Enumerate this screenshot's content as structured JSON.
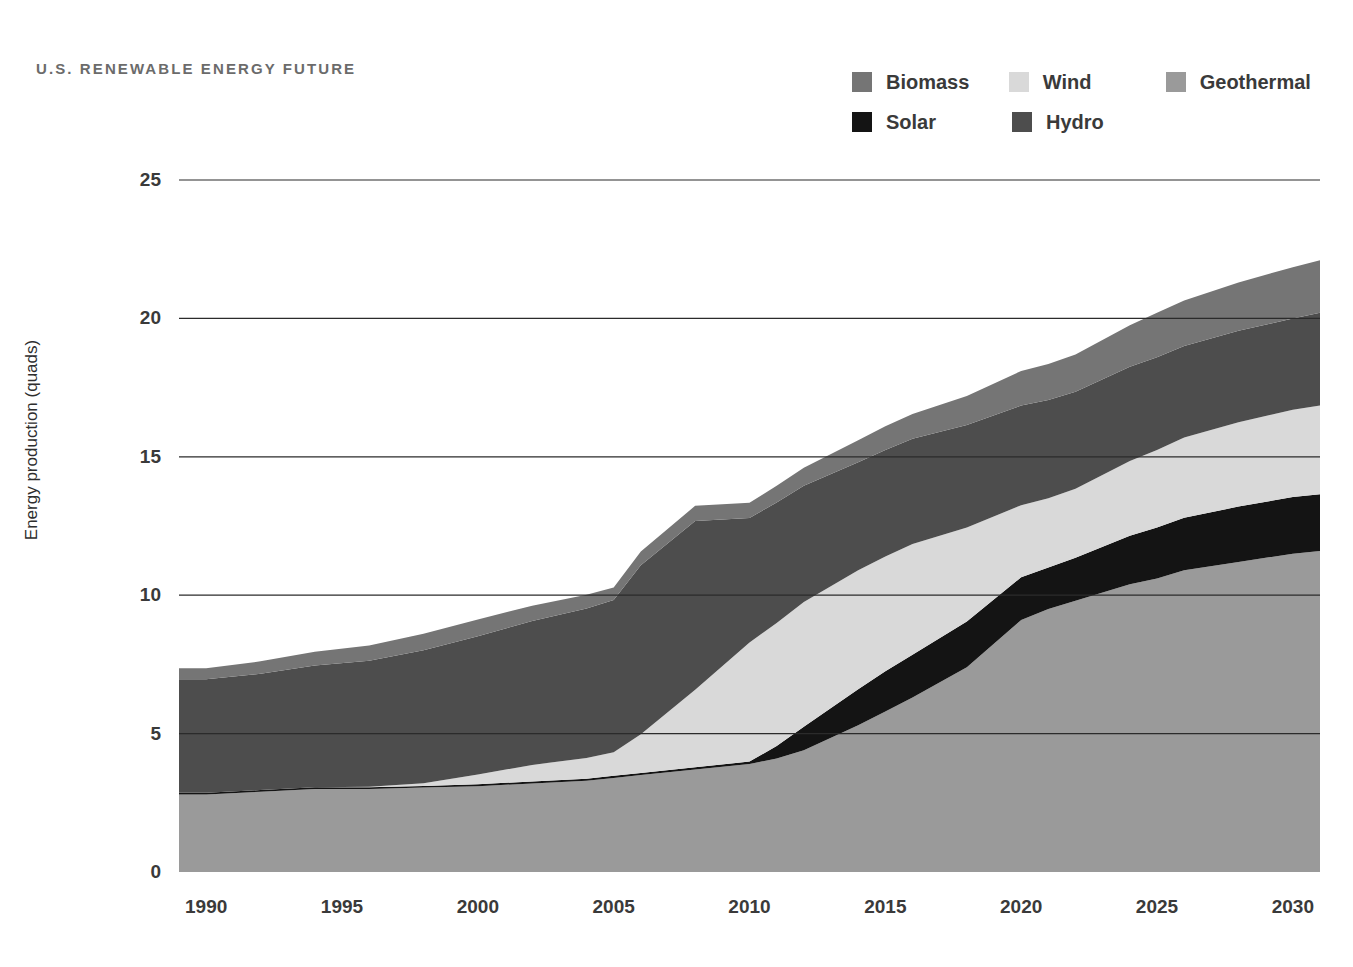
{
  "title": "U.S. RENEWABLE ENERGY FUTURE",
  "legend": {
    "row1": [
      {
        "label": "Biomass",
        "color": "#757575",
        "name": "legend-item-biomass"
      },
      {
        "label": "Wind",
        "color": "#d9d9d9",
        "name": "legend-item-wind"
      },
      {
        "label": "Geothermal",
        "color": "#9a9a9a",
        "name": "legend-item-geothermal"
      }
    ],
    "row2": [
      {
        "label": "Solar",
        "color": "#141414",
        "name": "legend-item-solar"
      },
      {
        "label": "Hydro",
        "color": "#4d4d4d",
        "name": "legend-item-hydro"
      }
    ]
  },
  "axes": {
    "ylabel": "Energy production (quads)",
    "yticks": [
      0,
      5,
      10,
      15,
      20,
      25
    ],
    "xticks": [
      1990,
      1995,
      2000,
      2005,
      2010,
      2015,
      2020,
      2025,
      2030
    ],
    "ylim": [
      0,
      25
    ],
    "xlim": [
      1989,
      2031
    ]
  },
  "chart_data": {
    "type": "area",
    "stacked": true,
    "title": "U.S. RENEWABLE ENERGY FUTURE",
    "xlabel": "",
    "ylabel": "Energy production (quads)",
    "ylim": [
      0,
      25
    ],
    "xlim": [
      1989,
      2031
    ],
    "grid": true,
    "legend_position": "top-right",
    "x": [
      1989,
      1990,
      1992,
      1994,
      1996,
      1998,
      2000,
      2002,
      2004,
      2005,
      2006,
      2008,
      2010,
      2011,
      2012,
      2014,
      2015,
      2016,
      2018,
      2020,
      2021,
      2022,
      2024,
      2025,
      2026,
      2028,
      2030,
      2031
    ],
    "stack_order": [
      "Geothermal",
      "Solar",
      "Wind",
      "Hydro",
      "Biomass"
    ],
    "series": [
      {
        "name": "Geothermal",
        "color": "#9a9a9a",
        "values": [
          2.8,
          2.8,
          2.9,
          3.0,
          3.0,
          3.05,
          3.1,
          3.2,
          3.3,
          3.4,
          3.5,
          3.7,
          3.9,
          4.1,
          4.4,
          5.3,
          5.8,
          6.3,
          7.4,
          9.1,
          9.5,
          9.8,
          10.4,
          10.6,
          10.9,
          11.2,
          11.5,
          11.6
        ]
      },
      {
        "name": "Solar",
        "color": "#141414",
        "values": [
          0.06,
          0.06,
          0.06,
          0.06,
          0.06,
          0.06,
          0.07,
          0.07,
          0.07,
          0.08,
          0.08,
          0.08,
          0.09,
          0.45,
          0.85,
          1.3,
          1.45,
          1.55,
          1.65,
          1.55,
          1.5,
          1.55,
          1.75,
          1.85,
          1.9,
          2.0,
          2.05,
          2.05
        ]
      },
      {
        "name": "Wind",
        "color": "#d9d9d9",
        "values": [
          0.0,
          0.0,
          0.0,
          0.0,
          0.02,
          0.1,
          0.35,
          0.6,
          0.75,
          0.85,
          1.4,
          2.8,
          4.3,
          4.45,
          4.5,
          4.3,
          4.15,
          4.0,
          3.4,
          2.6,
          2.5,
          2.5,
          2.7,
          2.8,
          2.9,
          3.05,
          3.15,
          3.2
        ]
      },
      {
        "name": "Hydro",
        "color": "#4d4d4d",
        "values": [
          4.1,
          4.1,
          4.2,
          4.4,
          4.55,
          4.8,
          5.0,
          5.2,
          5.4,
          5.5,
          6.1,
          6.1,
          4.5,
          4.35,
          4.2,
          3.9,
          3.85,
          3.8,
          3.7,
          3.6,
          3.55,
          3.5,
          3.4,
          3.35,
          3.3,
          3.3,
          3.3,
          3.35
        ]
      },
      {
        "name": "Biomass",
        "color": "#757575",
        "values": [
          0.4,
          0.4,
          0.45,
          0.5,
          0.55,
          0.6,
          0.6,
          0.55,
          0.5,
          0.45,
          0.5,
          0.55,
          0.55,
          0.6,
          0.65,
          0.8,
          0.85,
          0.9,
          1.05,
          1.25,
          1.3,
          1.35,
          1.5,
          1.6,
          1.65,
          1.75,
          1.85,
          1.9
        ]
      }
    ],
    "totals": [
      7.36,
      7.36,
      7.61,
      7.96,
      8.18,
      8.61,
      9.12,
      9.62,
      10.02,
      10.28,
      11.58,
      13.23,
      13.34,
      13.95,
      14.6,
      15.6,
      16.1,
      16.55,
      17.2,
      18.1,
      18.35,
      18.7,
      19.75,
      20.2,
      20.65,
      21.3,
      21.85,
      22.1
    ]
  }
}
